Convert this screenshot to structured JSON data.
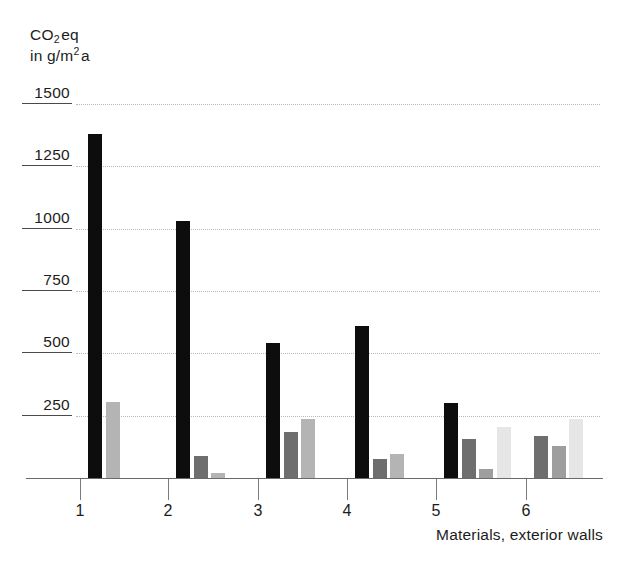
{
  "chart_data": {
    "type": "bar",
    "title": "",
    "subtitle": "",
    "ylabel_lines": [
      "CO2 eq",
      "in g/m2 a"
    ],
    "ylabel": "CO2 eq in g/m2 a",
    "xlabel": "Materials, exterior walls",
    "ylim": [
      0,
      1500
    ],
    "ytick_values": [
      250,
      500,
      750,
      1000,
      1250,
      1500
    ],
    "ytick_labels": [
      "250",
      "500",
      "750",
      "1000",
      "1250",
      "1500"
    ],
    "grid": true,
    "legend": "none",
    "categories": [
      "1",
      "2",
      "3",
      "4",
      "5",
      "6"
    ],
    "xtick_labels": [
      "1",
      "2",
      "3",
      "4",
      "5",
      "6"
    ],
    "bar_colors": {
      "black": "#0d0d0d",
      "dark_gray": "#6e6e6e",
      "mid_gray": "#9e9e9e",
      "light_gray": "#b4b4b4",
      "pale_gray": "#d5d5d5",
      "very_pale_gray": "#e6e6e6"
    },
    "groups": [
      {
        "category": "1",
        "bars": [
          {
            "value": 1380,
            "color": "#0d0d0d",
            "shade": "black"
          },
          {
            "value": 305,
            "color": "#b4b4b4",
            "shade": "light_gray"
          }
        ]
      },
      {
        "category": "2",
        "bars": [
          {
            "value": 1030,
            "color": "#0d0d0d",
            "shade": "black"
          },
          {
            "value": 90,
            "color": "#6e6e6e",
            "shade": "dark_gray"
          },
          {
            "value": 20,
            "color": "#b4b4b4",
            "shade": "light_gray"
          }
        ]
      },
      {
        "category": "3",
        "bars": [
          {
            "value": 540,
            "color": "#0d0d0d",
            "shade": "black"
          },
          {
            "value": 185,
            "color": "#6e6e6e",
            "shade": "dark_gray"
          },
          {
            "value": 235,
            "color": "#b4b4b4",
            "shade": "light_gray"
          }
        ]
      },
      {
        "category": "4",
        "bars": [
          {
            "value": 610,
            "color": "#0d0d0d",
            "shade": "black"
          },
          {
            "value": 75,
            "color": "#6e6e6e",
            "shade": "dark_gray"
          },
          {
            "value": 95,
            "color": "#b4b4b4",
            "shade": "light_gray"
          }
        ]
      },
      {
        "category": "5",
        "bars": [
          {
            "value": 300,
            "color": "#0d0d0d",
            "shade": "black"
          },
          {
            "value": 155,
            "color": "#6e6e6e",
            "shade": "dark_gray"
          },
          {
            "value": 35,
            "color": "#9e9e9e",
            "shade": "mid_gray"
          },
          {
            "value": 205,
            "color": "#e6e6e6",
            "shade": "very_pale_gray"
          }
        ]
      },
      {
        "category": "6",
        "bars": [
          {
            "value": 170,
            "color": "#6e6e6e",
            "shade": "dark_gray"
          },
          {
            "value": 130,
            "color": "#9e9e9e",
            "shade": "mid_gray"
          },
          {
            "value": 235,
            "color": "#e6e6e6",
            "shade": "very_pale_gray"
          }
        ]
      }
    ]
  }
}
